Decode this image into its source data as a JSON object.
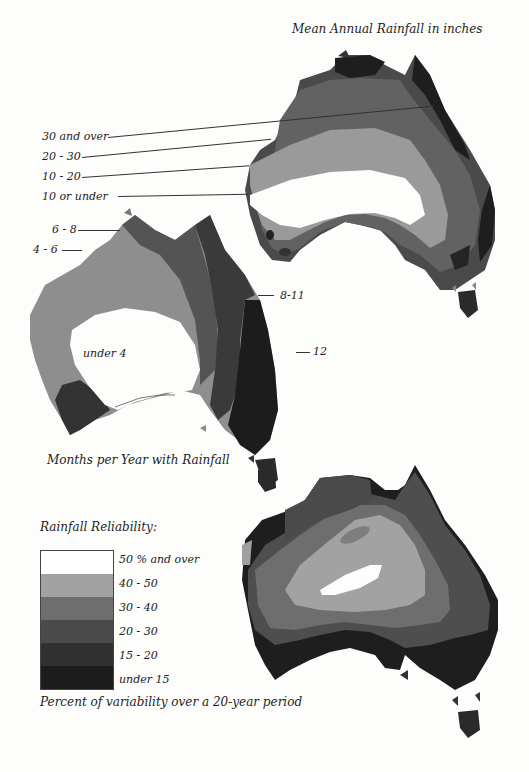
{
  "map1": {
    "title": "Mean Annual Rainfall in inches",
    "legend": [
      {
        "label": "30 and over",
        "color": "#2a2a2a"
      },
      {
        "label": "20 - 30",
        "color": "#5a5a5a"
      },
      {
        "label": "10 - 20",
        "color": "#9a9a9a"
      },
      {
        "label": "10  or under",
        "color": "#ffffff"
      }
    ]
  },
  "map2": {
    "title": "Months per Year with Rainfall",
    "labels": {
      "band_6_8": "6 - 8",
      "band_4_6": "4 - 6",
      "band_8_11": "8-11",
      "band_12": "12",
      "band_under_4": "under 4"
    }
  },
  "map3": {
    "title": "Rainfall Reliability:",
    "caption": "Percent of variability over a 20-year period",
    "legend": [
      {
        "label": "50 % and over",
        "color": "#ffffff"
      },
      {
        "label": "40 - 50",
        "color": "#a2a2a2"
      },
      {
        "label": "30 - 40",
        "color": "#6e6e6e"
      },
      {
        "label": "20 - 30",
        "color": "#4a4a4a"
      },
      {
        "label": "15 - 20",
        "color": "#303030"
      },
      {
        "label": "under 15",
        "color": "#1c1c1c"
      }
    ]
  }
}
